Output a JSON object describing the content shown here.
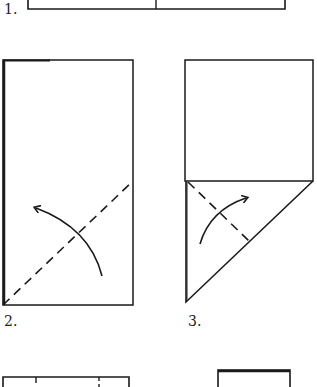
{
  "diagram": {
    "type": "origami-folding-steps",
    "line_color": "#1a1a1a",
    "background": "#ffffff",
    "steps": [
      {
        "number": "1.",
        "label_pos": [
          4,
          16
        ],
        "note": "bottom edge of rectangle divided by a center crease (partially visible at top)"
      },
      {
        "number": "2.",
        "label_pos": [
          4,
          316
        ],
        "note": "tall rectangle with diagonal dashed valley-fold line and curved arrow"
      },
      {
        "number": "3.",
        "label_pos": [
          188,
          316
        ],
        "note": "square with folded triangle below, dashed fold line and curved arrow"
      },
      {
        "number": "",
        "note": "next step rectangle with tick marks (partially visible at bottom-left)"
      },
      {
        "number": "",
        "note": "next step shape (partially visible at bottom-right)"
      }
    ]
  }
}
